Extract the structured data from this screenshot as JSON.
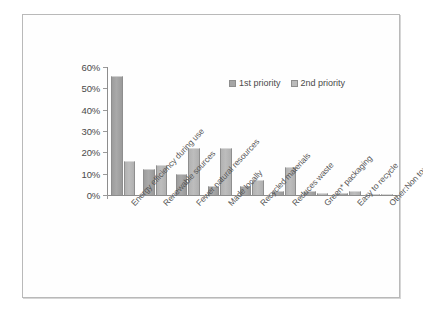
{
  "chart_data": {
    "type": "bar",
    "title": "",
    "xlabel": "",
    "ylabel": "",
    "ylim": [
      0,
      60
    ],
    "grid": false,
    "legend_position": "top-right",
    "ytick_labels": [
      "60%",
      "50%",
      "40%",
      "30%",
      "20%",
      "10%",
      "0%"
    ],
    "ytick_values": [
      60,
      50,
      40,
      30,
      20,
      10,
      0
    ],
    "categories": [
      "Energy efficiency during use",
      "Renewable sources",
      "Fewer natural resources",
      "Made locally",
      "Recycled materials",
      "Reduces waste",
      "Green* packaging",
      "Easy to recycle",
      "Other:Non toxic for family"
    ],
    "series": [
      {
        "name": "1st priority",
        "color": "#a5a5a5",
        "values": [
          56,
          12,
          10,
          4,
          4,
          2,
          2,
          1,
          0.5
        ]
      },
      {
        "name": "2nd priority",
        "color": "#bbbbbb",
        "values": [
          16,
          14,
          22,
          22,
          7,
          13,
          1,
          2,
          0.5
        ]
      }
    ]
  }
}
